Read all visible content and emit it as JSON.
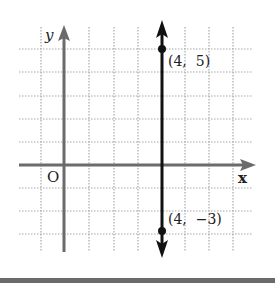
{
  "diagram": {
    "type": "coordinate-plane",
    "axes": {
      "x_label": "x",
      "y_label": "y",
      "origin_label": "O",
      "axis_color": "#6b6b6b"
    },
    "grid": {
      "x_range": [
        -2,
        8
      ],
      "y_range": [
        -4,
        6
      ],
      "style": "dotted",
      "color": "#b0b0b0"
    },
    "vertical_line": {
      "equation": "x = 4",
      "color": "#111111",
      "arrows": "both"
    },
    "points": [
      {
        "x": 4,
        "y": 5,
        "label": "(4,  5)"
      },
      {
        "x": 4,
        "y": -3,
        "label": "(4,  −3)"
      }
    ]
  }
}
